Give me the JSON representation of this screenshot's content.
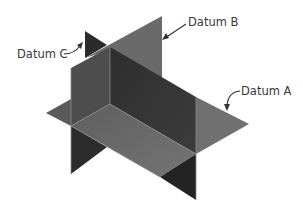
{
  "diagram": {
    "labels": {
      "datum_a": "Datum A",
      "datum_b": "Datum B",
      "datum_c": "Datum C"
    },
    "colors": {
      "plane_light": "#6f6f6f",
      "plane_mid": "#4a4a4a",
      "plane_dark": "#2a2a2a",
      "edge": "#8a8a8a",
      "text": "#3a3a3a"
    }
  }
}
